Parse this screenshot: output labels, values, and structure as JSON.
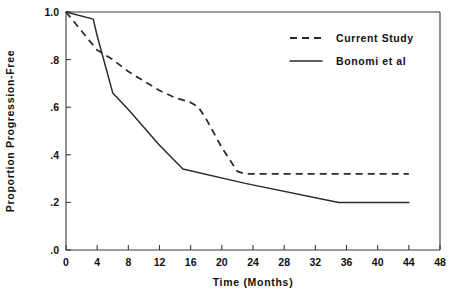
{
  "chart_data": {
    "type": "line",
    "title": "",
    "xlabel": "Time (Months)",
    "ylabel": "Proportion Progression-Free",
    "xlim": [
      0,
      48
    ],
    "ylim": [
      0.0,
      1.0
    ],
    "xticks": [
      0,
      4,
      8,
      12,
      16,
      20,
      24,
      28,
      32,
      36,
      40,
      44,
      48
    ],
    "xticklabels": [
      "0",
      "4",
      "8",
      "12",
      "16",
      "20",
      "24",
      "28",
      "32",
      "36",
      "40",
      "44",
      "48"
    ],
    "yticks": [
      0.0,
      0.2,
      0.4,
      0.6,
      0.8,
      1.0
    ],
    "yticklabels": [
      ".0",
      ".2",
      ".4",
      ".6",
      ".8",
      "1.0"
    ],
    "grid": false,
    "legend_position": "upper right",
    "series": [
      {
        "name": "Current Study",
        "style": "dashed",
        "color": "#2b2b2b",
        "points": [
          [
            0,
            1.0
          ],
          [
            2,
            0.92
          ],
          [
            4,
            0.84
          ],
          [
            6,
            0.8
          ],
          [
            8,
            0.75
          ],
          [
            10,
            0.71
          ],
          [
            12,
            0.67
          ],
          [
            14,
            0.64
          ],
          [
            16,
            0.62
          ],
          [
            17,
            0.6
          ],
          [
            18,
            0.55
          ],
          [
            20,
            0.43
          ],
          [
            22,
            0.33
          ],
          [
            23,
            0.32
          ],
          [
            44,
            0.32
          ]
        ]
      },
      {
        "name": "Bonomi et al",
        "style": "solid",
        "color": "#2b2b2b",
        "points": [
          [
            0,
            1.0
          ],
          [
            3.5,
            0.97
          ],
          [
            4,
            0.9
          ],
          [
            6,
            0.66
          ],
          [
            8,
            0.59
          ],
          [
            12,
            0.44
          ],
          [
            15,
            0.34
          ],
          [
            23,
            0.28
          ],
          [
            35,
            0.2
          ],
          [
            44,
            0.2
          ]
        ]
      }
    ]
  },
  "legend": {
    "entries": [
      {
        "label": "Current Study",
        "style": "dashed"
      },
      {
        "label": "Bonomi et al",
        "style": "solid"
      }
    ]
  }
}
